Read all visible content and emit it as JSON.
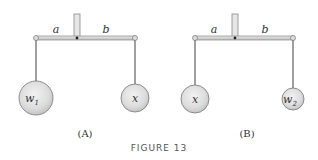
{
  "figure": {
    "caption": "FIGURE 13",
    "panels": [
      {
        "id": "A",
        "label": "(A)",
        "left_arm_label": "a",
        "right_arm_label": "b",
        "left_weight": {
          "symbol": "w",
          "subscript": "1"
        },
        "right_weight": {
          "symbol": "x",
          "subscript": ""
        }
      },
      {
        "id": "B",
        "label": "(B)",
        "left_arm_label": "a",
        "right_arm_label": "b",
        "left_weight": {
          "symbol": "x",
          "subscript": ""
        },
        "right_weight": {
          "symbol": "w",
          "subscript": "2"
        }
      }
    ]
  }
}
